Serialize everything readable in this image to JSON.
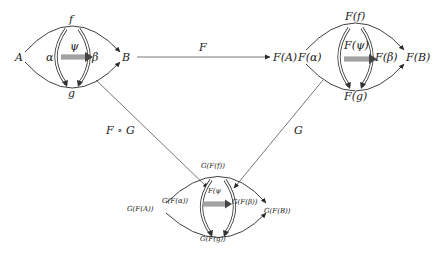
{
  "diagram": {
    "colors": {
      "stroke": "#2a2a2a",
      "text": "#1a1a1a",
      "background": "#ffffff"
    },
    "top_left": {
      "objects": {
        "source": "A",
        "target": "B"
      },
      "morphisms": {
        "top": "f",
        "bottom": "g"
      },
      "two_cells": {
        "left": "α",
        "right": "β"
      },
      "three_cell": "ψ"
    },
    "top_right": {
      "objects": {
        "source": "F(A)",
        "target": "F(B)"
      },
      "morphisms": {
        "top": "F(f)",
        "bottom": "F(g)"
      },
      "two_cells": {
        "left": "F(α)",
        "right": "F(β)"
      },
      "three_cell": "F(ψ)"
    },
    "bottom": {
      "objects": {
        "source": "G(F(A))",
        "target": "G(F(B))"
      },
      "morphisms": {
        "top": "G(F(f))",
        "bottom": "G(F(g))"
      },
      "two_cells": {
        "left": "G(F(α))",
        "right": "G(F(β))"
      },
      "three_cell": "F(ψ"
    },
    "functors": {
      "horizontal": "F",
      "diagonal_left": "F ∘ G",
      "diagonal_right": "G"
    }
  }
}
